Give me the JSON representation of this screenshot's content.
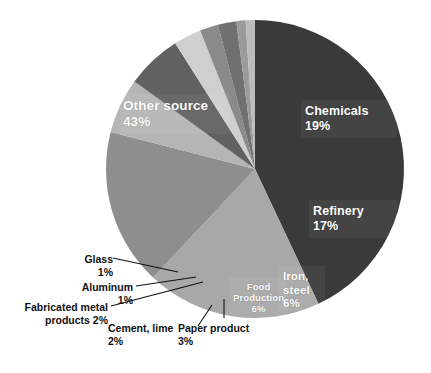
{
  "chart": {
    "type": "pie",
    "title": "",
    "center": {
      "x": 255,
      "y": 169
    },
    "radius": 149,
    "start_angle_deg": 0,
    "direction": "clockwise",
    "background": "#ffffff"
  },
  "chart_data": {
    "type": "pie",
    "title": "",
    "xlabel": "",
    "ylabel": "",
    "legend": "none",
    "labels": [
      "Other source",
      "Chemicals",
      "Refinery",
      "Iron, steel",
      "Food Production",
      "Paper product",
      "Cement, lime",
      "Fabricated metal products",
      "Aluminum",
      "Glass"
    ],
    "values": [
      43,
      19,
      17,
      6,
      6,
      3,
      2,
      2,
      1,
      1
    ],
    "value_unit": "%",
    "colors": [
      "#3a3a3a",
      "#a8a8a8",
      "#8e8e8e",
      "#b5b5b5",
      "#616161",
      "#cfcfcf",
      "#8a8a8a",
      "#707070",
      "#9b9b9b",
      "#bcbcbc"
    ],
    "slices": [
      {
        "label": "Other source",
        "value": 43,
        "display": "43%",
        "color": "#3a3a3a",
        "label_placement": "inside"
      },
      {
        "label": "Chemicals",
        "value": 19,
        "display": "19%",
        "color": "#a8a8a8",
        "label_placement": "inside"
      },
      {
        "label": "Refinery",
        "value": 17,
        "display": "17%",
        "color": "#8e8e8e",
        "label_placement": "inside"
      },
      {
        "label": "Iron, steel",
        "value": 6,
        "display": "6%",
        "color": "#b5b5b5",
        "label_placement": "inside"
      },
      {
        "label": "Food Production",
        "value": 6,
        "display": "6%",
        "color": "#616161",
        "label_placement": "inside"
      },
      {
        "label": "Paper product",
        "value": 3,
        "display": "3%",
        "color": "#cfcfcf",
        "label_placement": "callout"
      },
      {
        "label": "Cement, lime",
        "value": 2,
        "display": "2%",
        "color": "#8a8a8a",
        "label_placement": "callout"
      },
      {
        "label": "Fabricated metal products",
        "value": 2,
        "display": "2%",
        "color": "#707070",
        "label_placement": "callout"
      },
      {
        "label": "Aluminum",
        "value": 1,
        "display": "1%",
        "color": "#9b9b9b",
        "label_placement": "callout"
      },
      {
        "label": "Glass",
        "value": 1,
        "display": "1%",
        "color": "#bcbcbc",
        "label_placement": "callout"
      }
    ]
  },
  "labels_inside": {
    "other_source": {
      "name": "Other source",
      "value": "43%"
    },
    "chemicals": {
      "name": "Chemicals",
      "value": "19%"
    },
    "refinery": {
      "name": "Refinery",
      "value": "17%"
    },
    "iron_steel": {
      "name_line1": "Iron,",
      "name_line2": "steel",
      "value": "6%"
    },
    "food": {
      "name_line1": "Food",
      "name_line2": "Production",
      "value": "6%"
    }
  },
  "labels_callout": {
    "glass": {
      "text": "Glass\n1%"
    },
    "aluminum": {
      "text": "Aluminum\n1%"
    },
    "fabricated": {
      "text": "Fabricated metal\nproducts 2%"
    },
    "cement": {
      "text": "Cement, lime\n2%"
    },
    "paper": {
      "text": "Paper product\n3%"
    }
  }
}
